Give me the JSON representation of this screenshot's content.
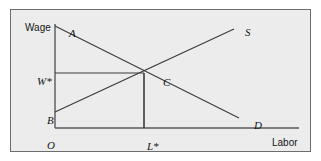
{
  "figure": {
    "type": "labor-market-supply-demand-diagram",
    "axes": {
      "y_axis_label": "Wage",
      "x_axis_label": "Labor",
      "origin_label": "O"
    },
    "labels": {
      "demand_intercept": "A",
      "supply_intercept": "B",
      "equilibrium_point": "C",
      "supply_curve": "S",
      "demand_curve": "D",
      "equilibrium_wage": "W*",
      "equilibrium_labor": "L*"
    },
    "colors": {
      "background": "#ececed",
      "border": "#6d6d6d",
      "line": "#3a3a3a",
      "axis": "#5a5a5a",
      "text": "#141414"
    },
    "geometry": {
      "origin": [
        44,
        118
      ],
      "y_axis_top": [
        44,
        14
      ],
      "x_axis_right": [
        288,
        118
      ],
      "demand_start": [
        44,
        16
      ],
      "demand_end": [
        228,
        108
      ],
      "supply_start": [
        44,
        102
      ],
      "supply_end": [
        223,
        19
      ],
      "equilibrium": [
        133,
        63
      ],
      "wage_line_start": [
        44,
        63
      ],
      "labor_line_end": [
        133,
        118
      ]
    }
  }
}
